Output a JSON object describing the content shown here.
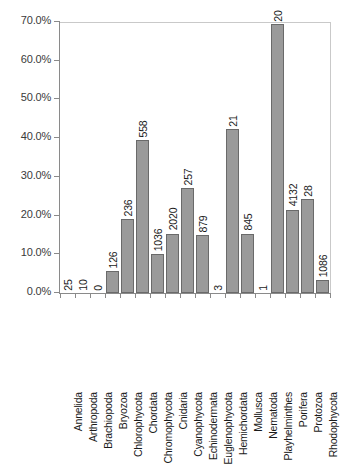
{
  "chart_data": {
    "type": "bar",
    "title": "",
    "xlabel": "",
    "ylabel": "",
    "ylim": [
      0,
      70
    ],
    "yunit": "%",
    "grid": false,
    "legend": "none",
    "bar_color": "#9a9a9a",
    "bar_edge_color": "#6a6a6a",
    "ytick_labels": [
      "70.0%",
      "60.0%",
      "50.0%",
      "40.0%",
      "30.0%",
      "20.0%",
      "10.0%",
      "0.0%"
    ],
    "ytick_values": [
      70,
      60,
      50,
      40,
      30,
      20,
      10,
      0
    ],
    "categories": [
      "Annelida",
      "Arthropoda",
      "Brachiopoda",
      "Bryozoa",
      "Chlorophycota",
      "Chordata",
      "Chromophycota",
      "Cnidaria",
      "Cyanophycota",
      "Echinodermata",
      "Euglenophycota",
      "Hemichordata",
      "Mollusca",
      "Nematoda",
      "Playhelminthes",
      "Porifera",
      "Protozoa",
      "Rhodophycota"
    ],
    "values": [
      0.0,
      0.0,
      0.0,
      5.6,
      19.0,
      39.5,
      10.0,
      15.3,
      27.0,
      15.0,
      0.0,
      42.3,
      15.3,
      0.0,
      69.5,
      21.5,
      24.3,
      3.3
    ],
    "data_labels": [
      "25",
      "10",
      "0",
      "126",
      "236",
      "558",
      "1036",
      "2020",
      "257",
      "879",
      "3",
      "21",
      "845",
      "1",
      "20",
      "4132",
      "28",
      "1086"
    ],
    "counts": [
      25,
      10,
      0,
      126,
      236,
      558,
      1036,
      2020,
      257,
      879,
      3,
      21,
      845,
      1,
      20,
      4132,
      28,
      1086
    ]
  },
  "caption": ""
}
